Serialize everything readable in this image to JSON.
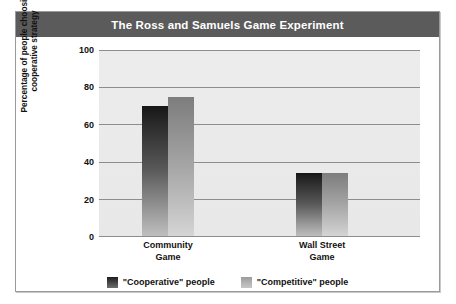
{
  "figure": {
    "title": "The Ross and Samuels Game Experiment"
  },
  "chart_data": {
    "type": "bar",
    "title": "The Ross and Samuels Game Experiment",
    "xlabel": "",
    "ylabel": "Percentage of people choosing\ncooperative strategy",
    "categories": [
      "Community\nGame",
      "Wall Street\nGame"
    ],
    "series": [
      {
        "name": "\"Cooperative\" people",
        "values": [
          70,
          34
        ],
        "color": "#2b2b2b"
      },
      {
        "name": "\"Competitive\" people",
        "values": [
          75,
          34
        ],
        "color": "#a6a6a6"
      }
    ],
    "ylim": [
      0,
      100
    ],
    "yticks": [
      0,
      20,
      40,
      60,
      80,
      100
    ],
    "ytick_labels": [
      "0",
      "20",
      "40",
      "60",
      "80",
      "100"
    ],
    "grid": true,
    "legend_position": "bottom"
  },
  "legend": {
    "items": [
      {
        "label": "\"Cooperative\" people"
      },
      {
        "label": "\"Competitive\" people"
      }
    ]
  },
  "colors": {
    "title_bar": "#5b5b5b",
    "plot_background": "#ebebeb",
    "gridline": "#8d8d8d",
    "frame_border": "#9a9a9a",
    "text": "#111111"
  }
}
